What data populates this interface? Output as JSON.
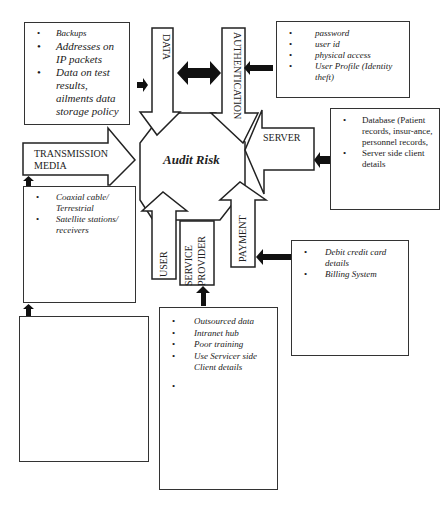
{
  "center": {
    "label": "Audit Risk"
  },
  "arrows": {
    "data": "DATA",
    "authentication": "AUTHENTICATION",
    "transmission_media": [
      "TRANSMISSION",
      "MEDIA"
    ],
    "server": "SERVER",
    "user": "USER",
    "service_provider": [
      "SERVICE",
      "PROVIDER"
    ],
    "payment": "PAYMENT"
  },
  "boxes": {
    "data_box": {
      "items": [
        "Backups",
        "Addresses on IP packets",
        "Data on test results, ailments data storage policy"
      ]
    },
    "authentication_box": {
      "items": [
        "password",
        "user id",
        "physical access",
        "User Profile (Identity theft)"
      ]
    },
    "server_box": {
      "items": [
        "Database (Patient records, insur-ance, personnel records,",
        "Server side client details"
      ]
    },
    "transmission_box": {
      "items": [
        "Coaxial cable/ Terrestrial",
        "Satellite stations/ receivers"
      ]
    },
    "payment_box": {
      "items": [
        "Debit credit card details",
        "Billing System"
      ]
    },
    "service_provider_box": {
      "items": [
        "Outsourced data",
        "Intranet hub",
        "Poor training",
        "Use Servicer side Client details",
        ""
      ]
    },
    "user_box": {
      "items": []
    }
  }
}
